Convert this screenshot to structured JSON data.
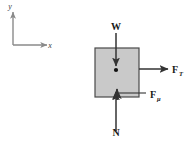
{
  "figure": {
    "type": "free-body-diagram",
    "background_color": "#ffffff"
  },
  "coordinate_axes": {
    "name": "coordinate-axes",
    "y_label": "y",
    "x_label": "x",
    "line_color": "#8a8a8a",
    "origin": {
      "x": 13,
      "y": 45
    },
    "y_tip": {
      "x": 13,
      "y": 12
    },
    "x_tip": {
      "x": 47,
      "y": 45
    }
  },
  "block": {
    "name": "block",
    "fill_color": "#c9c9c9",
    "border_color": "#4a4a4a",
    "left": 95,
    "top": 48,
    "width": 44,
    "height": 49
  },
  "center_of_mass": {
    "name": "center-of-mass-dot",
    "color": "#111111",
    "x": 116,
    "y": 70,
    "radius": 2.1
  },
  "forces": [
    {
      "id": "weight",
      "label": "W",
      "subscript": "",
      "direction": "down",
      "label_x": 116,
      "label_y": 30,
      "arrow_start": {
        "x": 116,
        "y": 33
      },
      "arrow_end": {
        "x": 116,
        "y": 66
      },
      "color": "#333333"
    },
    {
      "id": "applied-tension",
      "label": "F",
      "subscript": "T",
      "direction": "right",
      "label_x": 172,
      "label_y": 73,
      "arrow_start": {
        "x": 139,
        "y": 69
      },
      "arrow_end": {
        "x": 168,
        "y": 69
      },
      "color": "#333333"
    },
    {
      "id": "friction",
      "label": "F",
      "subscript": "μ",
      "direction": "up",
      "label_x": 150,
      "label_y": 98,
      "arrow_start": {
        "x": 117,
        "y": 100
      },
      "arrow_end": {
        "x": 117,
        "y": 89
      },
      "color": "#333333"
    },
    {
      "id": "normal",
      "label": "N",
      "subscript": "",
      "direction": "up",
      "label_x": 116,
      "label_y": 136,
      "arrow_start": {
        "x": 116,
        "y": 131
      },
      "arrow_end": {
        "x": 116,
        "y": 92
      },
      "color": "#333333"
    }
  ],
  "leader_line": {
    "name": "friction-leader-line",
    "from": {
      "x": 119,
      "y": 93
    },
    "to": {
      "x": 146,
      "y": 93
    },
    "color": "#333333"
  }
}
